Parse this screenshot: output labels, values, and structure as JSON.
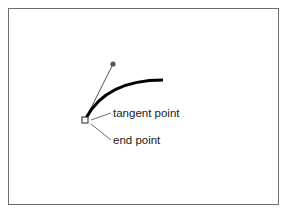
{
  "diagram": {
    "labels": {
      "tangent": "tangent point",
      "end": "end point"
    },
    "colors": {
      "frame": "#6e6e6e",
      "curve": "#000000",
      "handle": "#555555",
      "leader": "#444444",
      "background": "#ffffff"
    },
    "geometry": {
      "end_point": [
        85,
        120
      ],
      "handle_point": [
        113,
        64
      ],
      "curve_end": [
        163,
        80
      ]
    }
  }
}
